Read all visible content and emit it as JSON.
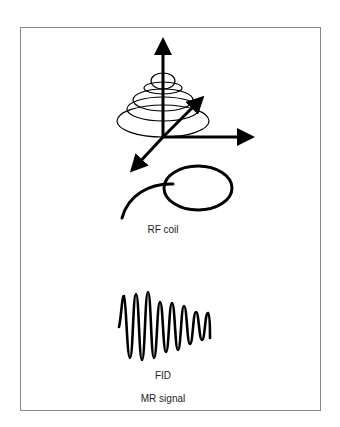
{
  "figure": {
    "labels": {
      "rf_coil": "RF coil",
      "fid": "FID",
      "mr_signal": "MR signal"
    },
    "colors": {
      "stroke": "#000000",
      "frame_border": "#8a8a8a",
      "background": "#ffffff"
    },
    "parts": [
      "precession-cone-with-axes",
      "rf-coil-loop",
      "free-induction-decay-waveform"
    ]
  }
}
